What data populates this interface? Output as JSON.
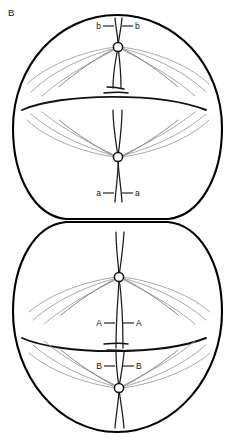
{
  "figure": {
    "panel_label": "B",
    "background_color": "#ffffff",
    "line_color": "#000000",
    "fiber_color": "#9a9a9a",
    "width": 227,
    "height": 438
  },
  "cells": [
    {
      "id": "upper-cell",
      "name": "upper-daughter-cell",
      "cx": 117,
      "cy": 115,
      "rx": 105,
      "ry": 105,
      "spindles": [
        {
          "id": "upper-cell-spindle-top",
          "centromere": {
            "cx": 118,
            "cy": 47,
            "r": 4.6
          },
          "labels": {
            "left": "b",
            "right": "b"
          },
          "label_y": 26
        },
        {
          "id": "upper-cell-spindle-bottom",
          "centromere": {
            "cx": 118,
            "cy": 157,
            "r": 4.6
          },
          "labels": {
            "left": "a",
            "right": "a"
          },
          "label_y": 193
        }
      ]
    },
    {
      "id": "lower-cell",
      "name": "lower-daughter-cell",
      "cx": 117,
      "cy": 327,
      "rx": 105,
      "ry": 105,
      "spindles": [
        {
          "id": "lower-cell-spindle-top",
          "centromere": {
            "cx": 119,
            "cy": 277,
            "r": 4.6
          },
          "labels": {
            "left": "A",
            "right": "A"
          },
          "label_y": 323
        },
        {
          "id": "lower-cell-spindle-bottom",
          "centromere": {
            "cx": 119,
            "cy": 388,
            "r": 4.6
          },
          "labels": {
            "left": "B",
            "right": "B"
          },
          "label_y": 366
        }
      ]
    }
  ],
  "labels": {
    "panel": "B",
    "upper_cell_top_left": "b",
    "upper_cell_top_right": "b",
    "upper_cell_bottom_left": "a",
    "upper_cell_bottom_right": "a",
    "lower_cell_top_left": "A",
    "lower_cell_top_right": "A",
    "lower_cell_bottom_left": "B",
    "lower_cell_bottom_right": "B"
  }
}
